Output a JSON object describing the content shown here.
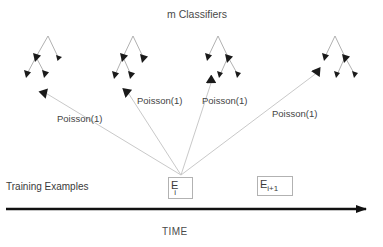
{
  "diagram": {
    "title": "m Classifiers",
    "axis_label": "TIME",
    "left_caption": "Training Examples",
    "edge_labels": [
      "Poisson(1)",
      "Poisson(1)",
      "Poisson(1)",
      "Poisson(1)"
    ],
    "event_boxes": [
      {
        "base": "E",
        "subscript": "i"
      },
      {
        "base": "E",
        "subscript": "i+1"
      }
    ],
    "colors": {
      "text": "#3b3b3b",
      "connector_line": "#c9c9c9",
      "tree_line": "#a8a8a8",
      "node_fill": "#1a1a1a",
      "axis": "#111111",
      "box_border": "#b2b2b2",
      "background": "#ffffff"
    },
    "classifier_count": 4,
    "timeline": {
      "start_x": 6,
      "end_x": 368,
      "y": 209
    },
    "convergence_point": {
      "x": 182,
      "y": 176
    }
  }
}
